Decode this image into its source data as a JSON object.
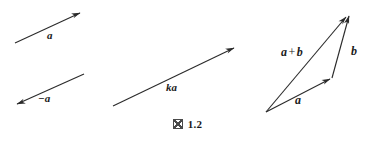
{
  "figure": {
    "caption_mark": "図",
    "caption_number": "1.2",
    "background_color": "#ffffff",
    "stroke_color": "#2b2b2b",
    "label_color": "#1a1a1a"
  },
  "panels": {
    "left": {
      "vectors": [
        {
          "name": "vector-a",
          "label": "a",
          "label_x": 47,
          "label_y": 30,
          "x1": 15,
          "y1": 43,
          "x2": 82,
          "y2": 12,
          "arrow_at": "head"
        },
        {
          "name": "vector-negative-a",
          "label": "−a",
          "label_x": 38,
          "label_y": 93,
          "x1": 84,
          "y1": 74,
          "x2": 15,
          "y2": 105,
          "arrow_at": "head"
        }
      ]
    },
    "middle": {
      "vectors": [
        {
          "name": "vector-ka",
          "label": "ka",
          "label_x": 166,
          "label_y": 82,
          "x1": 113,
          "y1": 106,
          "x2": 237,
          "y2": 46,
          "arrow_at": "head"
        }
      ]
    },
    "right": {
      "description": "triangle rule for vector addition",
      "vertices": {
        "origin": {
          "x": 266,
          "y": 112
        },
        "mid": {
          "x": 332,
          "y": 78
        },
        "apex": {
          "x": 350,
          "y": 13
        }
      },
      "vectors": [
        {
          "name": "vector-a",
          "label": "a",
          "label_x": 295,
          "label_y": 94,
          "x1": 266,
          "y1": 112,
          "x2": 332,
          "y2": 78,
          "arrow_at": "head"
        },
        {
          "name": "vector-b",
          "label": "b",
          "label_x": 351,
          "label_y": 45,
          "x1": 332,
          "y1": 78,
          "x2": 350,
          "y2": 13,
          "arrow_at": "head"
        },
        {
          "name": "vector-a-plus-b",
          "label_lhs": "a",
          "label_op": "+",
          "label_rhs": "b",
          "label_x": 281,
          "label_y": 46,
          "x1": 266,
          "y1": 112,
          "x2": 348,
          "y2": 14,
          "arrow_at": "head"
        }
      ]
    }
  }
}
